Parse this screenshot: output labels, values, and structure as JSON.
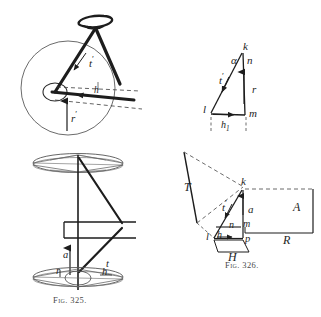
{
  "page": {
    "width": 321,
    "height": 317,
    "background": "#ffffff",
    "ink": "#1d1d1d",
    "faint_ink": "#6b6b6b"
  },
  "figures": [
    {
      "id": "fig-325-perspective-wheel",
      "caption": "",
      "description": "Perspective view of a bicycle wheel with fork and saddle",
      "labels": [
        {
          "name": "label-t-prime",
          "text": "t",
          "prime": true
        },
        {
          "name": "label-h",
          "text": "h",
          "prime": false
        },
        {
          "name": "label-r-prime",
          "text": "r",
          "prime": true
        }
      ]
    },
    {
      "id": "fig-force-triangle",
      "caption": "",
      "description": "Force triangle with vertices k, l, m and angle alpha",
      "labels": [
        {
          "name": "label-k",
          "text": "k",
          "prime": false
        },
        {
          "name": "label-alpha",
          "text": "α",
          "prime": false
        },
        {
          "name": "label-n",
          "text": "n",
          "prime": false
        },
        {
          "name": "label-t-prime",
          "text": "t",
          "prime": true
        },
        {
          "name": "label-r",
          "text": "r",
          "prime": false
        },
        {
          "name": "label-l",
          "text": "l",
          "prime": false
        },
        {
          "name": "label-m",
          "text": "m",
          "prime": false
        },
        {
          "name": "label-h-one",
          "text": "h",
          "sub": "1"
        }
      ]
    },
    {
      "id": "fig-325-front-wheel",
      "caption": "Fig. 325.",
      "description": "Front elevation of wheel with hub, rim ellipses and force vectors",
      "labels": [
        {
          "name": "label-a",
          "text": "a",
          "prime": false
        },
        {
          "name": "label-t",
          "text": "t",
          "prime": false
        },
        {
          "name": "label-r",
          "text": "r",
          "prime": false
        },
        {
          "name": "label-h",
          "text": "h",
          "prime": false
        }
      ]
    },
    {
      "id": "fig-326-force-diagram",
      "caption": "Fig. 326.",
      "description": "Spatial force diagram with planes T, H, A, R and vectors",
      "labels": [
        {
          "name": "label-T",
          "text": "T",
          "prime": false
        },
        {
          "name": "label-k",
          "text": "k",
          "prime": false
        },
        {
          "name": "label-t-prime",
          "text": "t",
          "prime": true
        },
        {
          "name": "label-a",
          "text": "a",
          "prime": false
        },
        {
          "name": "label-A",
          "text": "A",
          "prime": false
        },
        {
          "name": "label-n",
          "text": "n",
          "prime": false
        },
        {
          "name": "label-m",
          "text": "m",
          "prime": false
        },
        {
          "name": "label-l",
          "text": "l",
          "prime": false
        },
        {
          "name": "label-h",
          "text": "h",
          "prime": false
        },
        {
          "name": "label-p",
          "text": "p",
          "prime": false
        },
        {
          "name": "label-R",
          "text": "R",
          "prime": false
        },
        {
          "name": "label-H",
          "text": "H",
          "prime": false
        }
      ]
    }
  ],
  "captions": {
    "fig_325": "Fig. 325.",
    "fig_326": "Fig. 326."
  },
  "labels": {
    "wheel_t_prime": "t",
    "wheel_h": "h",
    "wheel_r_prime": "r",
    "tri_k": "k",
    "tri_alpha": "α",
    "tri_n": "n",
    "tri_t_prime": "t",
    "tri_r": "r",
    "tri_l": "l",
    "tri_m": "m",
    "tri_h": "h",
    "tri_h_sub": "1",
    "front_a": "a",
    "front_t": "t",
    "front_r": "r",
    "front_h": "h",
    "sp_T": "T",
    "sp_k": "k",
    "sp_t_prime": "t",
    "sp_a": "a",
    "sp_A": "A",
    "sp_n": "n",
    "sp_m": "m",
    "sp_l": "l",
    "sp_h": "h",
    "sp_p": "p",
    "sp_R": "R",
    "sp_H": "H"
  }
}
